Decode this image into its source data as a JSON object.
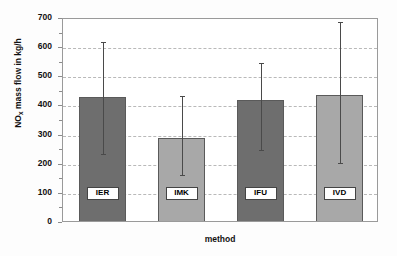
{
  "chart_data": {
    "type": "bar",
    "title": "",
    "xlabel": "method",
    "ylabel": "NOx mass flow in kg/h",
    "ylabel_base": "NO",
    "ylabel_sub": "x",
    "ylabel_rest": " mass flow in kg/h",
    "categories": [
      "IER",
      "IMK",
      "IFU",
      "IVD"
    ],
    "values": [
      432,
      290,
      422,
      440
    ],
    "error_low": [
      237,
      163,
      250,
      205
    ],
    "error_high": [
      620,
      437,
      550,
      690
    ],
    "ylim": [
      0,
      700
    ],
    "yticks": [
      0,
      100,
      200,
      300,
      400,
      500,
      600,
      700
    ],
    "ytick_labels": [
      "0",
      "100",
      "200",
      "300",
      "400",
      "500",
      "600",
      "700"
    ],
    "yminor_step": 50,
    "grid": true,
    "legend": "none",
    "bar_colors": [
      "#6e6e6e",
      "#a8a8a8",
      "#6e6e6e",
      "#a8a8a8"
    ],
    "bar_edge_color": "#5a5a5a",
    "error_color": "#4a4a4a",
    "grid_color": "#b9b9b9",
    "frame_color": "#9a9a9a"
  }
}
